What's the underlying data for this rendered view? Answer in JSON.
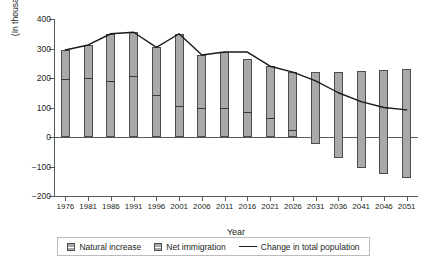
{
  "chart_data": {
    "type": "bar",
    "title": "",
    "xlabel": "Year",
    "ylabel": "(In thousands)",
    "ylim": [
      -200,
      400
    ],
    "yticks": [
      400,
      300,
      200,
      100,
      0,
      -100,
      -200
    ],
    "ytick_labels": [
      "400",
      "300",
      "200",
      "100",
      "0",
      "−100",
      "−200"
    ],
    "grid": false,
    "legend_position": "bottom",
    "categories": [
      "1976",
      "1981",
      "1986",
      "1991",
      "1996",
      "2001",
      "2006",
      "2011",
      "2016",
      "2021",
      "2026",
      "2031",
      "2036",
      "2041",
      "2046",
      "2051"
    ],
    "series": [
      {
        "name": "Natural increase",
        "type": "bar-segment",
        "values": [
          195,
          200,
          190,
          207,
          142,
          105,
          100,
          100,
          85,
          65,
          25,
          -25,
          -70,
          -105,
          -125,
          -140
        ]
      },
      {
        "name": "Net immigration",
        "type": "bar-segment",
        "values": [
          100,
          112,
          160,
          148,
          162,
          245,
          178,
          188,
          180,
          175,
          195,
          245,
          290,
          330,
          352,
          370
        ]
      },
      {
        "name": "Change in total population",
        "type": "line",
        "values": [
          295,
          312,
          350,
          355,
          304,
          350,
          278,
          288,
          288,
          240,
          220,
          190,
          150,
          120,
          100,
          92
        ]
      }
    ],
    "bar_tops": [
      295,
      312,
      350,
      355,
      304,
      350,
      278,
      288,
      265,
      240,
      220,
      220,
      220,
      225,
      227,
      230
    ],
    "bar_bottoms": [
      0,
      0,
      0,
      0,
      0,
      0,
      0,
      0,
      0,
      0,
      0,
      -25,
      -70,
      -105,
      -125,
      -140
    ],
    "bar_dividers": [
      195,
      200,
      190,
      207,
      142,
      105,
      100,
      100,
      85,
      65,
      25,
      null,
      null,
      null,
      null,
      null
    ]
  },
  "legend": {
    "items": [
      {
        "label": "Natural increase",
        "marker": "swatch-gray"
      },
      {
        "label": "Net immigration",
        "marker": "swatch-gray"
      },
      {
        "label": "Change in total population",
        "marker": "line-black"
      }
    ]
  },
  "colors": {
    "bar_fill": "#a9a9a9",
    "bar_border": "#4d4d4d",
    "line": "#1a1a1a",
    "axis": "#58595b",
    "text": "#231f20"
  }
}
